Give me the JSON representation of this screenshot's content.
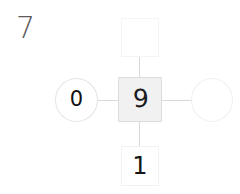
{
  "problem": {
    "number": "7"
  },
  "diagram": {
    "type": "number-bond",
    "center": {
      "shape": "square",
      "value": "9",
      "filled": true,
      "fill_color": "#f1f1f1"
    },
    "branches": [
      {
        "position": "top",
        "shape": "square",
        "value": "",
        "empty": true
      },
      {
        "position": "left",
        "shape": "circle",
        "value": "0",
        "empty": false
      },
      {
        "position": "right",
        "shape": "circle",
        "value": "",
        "empty": true
      },
      {
        "position": "bottom",
        "shape": "square",
        "value": "1",
        "empty": false
      }
    ],
    "connector_color": "#d8d8d8",
    "border_color": "#e4e4e4",
    "text_color": "#1c1c1c",
    "label_color": "#5a5a5a",
    "background": "#ffffff"
  }
}
